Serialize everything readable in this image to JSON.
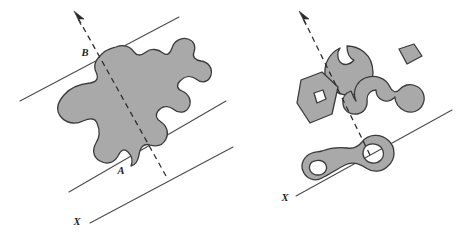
{
  "figure": {
    "background_color": "#ffffff",
    "width": 463,
    "height": 238,
    "style": {
      "region_fill": "#a9a9a9",
      "region_stroke": "#3a3a3a",
      "line_color": "#4a4a4a",
      "dashed_color": "#2b2b2b",
      "label_color": "#1d1d1d",
      "hole_fill": "#ffffff"
    }
  },
  "panels": [
    {
      "id": "left-panel",
      "name": "single-blob-panel",
      "labels": [
        {
          "id": "label-b",
          "text": "B",
          "x": 85,
          "y": 56
        },
        {
          "id": "label-a",
          "text": "A",
          "x": 121,
          "y": 174
        },
        {
          "id": "label-x-left",
          "text": "X",
          "x": 77,
          "y": 225
        }
      ],
      "lines": [
        {
          "id": "support-line-top",
          "type": "solid",
          "x1": 20,
          "y1": 101,
          "x2": 179,
          "y2": 17
        },
        {
          "id": "support-line-middle",
          "type": "solid",
          "x1": 69,
          "y1": 192,
          "x2": 226,
          "y2": 101
        },
        {
          "id": "support-line-bottom",
          "type": "solid",
          "x1": 90,
          "y1": 223,
          "x2": 233,
          "y2": 147
        },
        {
          "id": "direction-axis-dashed",
          "type": "dashed",
          "x1": 166,
          "y1": 176,
          "x2": 77,
          "y2": 16
        }
      ],
      "arrow": {
        "id": "direction-arrow-left",
        "tip_x": 74,
        "tip_y": 11
      },
      "regions": [
        {
          "id": "blob-amoeba",
          "name": "non-convex-blob",
          "has_holes": false
        }
      ]
    },
    {
      "id": "right-panel",
      "name": "multi-shape-panel",
      "labels": [
        {
          "id": "label-x-right",
          "text": "X",
          "x": 285,
          "y": 201
        }
      ],
      "lines": [
        {
          "id": "support-line-right",
          "type": "solid",
          "x1": 296,
          "y1": 196,
          "x2": 452,
          "y2": 110
        },
        {
          "id": "direction-axis-dashed-right",
          "type": "dashed",
          "x1": 370,
          "y1": 155,
          "x2": 302,
          "y2": 16
        }
      ],
      "arrow": {
        "id": "direction-arrow-right",
        "tip_x": 299,
        "tip_y": 11
      },
      "regions": [
        {
          "id": "shape-pacman",
          "name": "pacman-wedge-shape",
          "has_holes": false
        },
        {
          "id": "shape-small-quad",
          "name": "small-quadrilateral",
          "has_holes": false
        },
        {
          "id": "shape-polygon-hole",
          "name": "polygon-with-diamond-hole",
          "has_holes": true
        },
        {
          "id": "shape-horseshoe",
          "name": "horseshoe-shape",
          "has_holes": false
        },
        {
          "id": "shape-peanut",
          "name": "peanut-with-two-holes",
          "has_holes": true
        }
      ]
    }
  ]
}
